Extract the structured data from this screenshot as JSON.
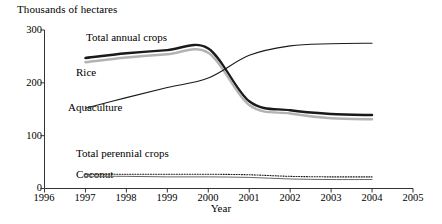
{
  "chart_data": {
    "type": "line",
    "title": "",
    "ylabel": "Thousands of hectares",
    "xlabel": "Year",
    "xlim": [
      1996,
      2005
    ],
    "ylim": [
      0,
      300
    ],
    "yticks": [
      0,
      100,
      200,
      300
    ],
    "xticks": [
      1996,
      1997,
      1998,
      1999,
      2000,
      2001,
      2002,
      2003,
      2004,
      2005
    ],
    "grid": false,
    "legend_position": "inline-labels",
    "x": [
      1997,
      1998,
      1999,
      2000,
      2001,
      2002,
      2003,
      2004
    ],
    "series": [
      {
        "name": "Total annual crops",
        "style": "thick-solid-black",
        "color": "#1a1a1a",
        "values": [
          247,
          256,
          262,
          265,
          165,
          148,
          141,
          139
        ]
      },
      {
        "name": "Rice",
        "style": "thick-solid-gray",
        "color": "#b3b3b3",
        "values": [
          239,
          248,
          254,
          257,
          158,
          142,
          133,
          131
        ]
      },
      {
        "name": "Aquaculture",
        "style": "thin-solid-black",
        "color": "#1a1a1a",
        "values": [
          152,
          172,
          191,
          209,
          252,
          270,
          274,
          275
        ]
      },
      {
        "name": "Total perennial crops",
        "style": "dotted-black",
        "color": "#1a1a1a",
        "values": [
          27,
          27,
          27,
          27,
          26,
          23,
          22,
          22
        ]
      },
      {
        "name": "Coconut",
        "style": "thin-solid-gray",
        "color": "#666666",
        "values": [
          23,
          23,
          22,
          22,
          21,
          18,
          17,
          17
        ]
      }
    ]
  },
  "labels": {
    "y_axis_title": "Thousands of hectares",
    "x_axis_title": "Year",
    "ytick_300": "300",
    "ytick_200": "200",
    "ytick_100": "100",
    "ytick_0": "0",
    "xtick_1996": "1996",
    "xtick_1997": "1997",
    "xtick_1998": "1998",
    "xtick_1999": "1999",
    "xtick_2000": "2000",
    "xtick_2001": "2001",
    "xtick_2002": "2002",
    "xtick_2003": "2003",
    "xtick_2004": "2004",
    "xtick_2005": "2005",
    "series_total_annual_crops": "Total annual crops",
    "series_rice": "Rice",
    "series_aquaculture": "Aquaculture",
    "series_total_perennial_crops": "Total perennial crops",
    "series_coconut": "Coconut"
  }
}
